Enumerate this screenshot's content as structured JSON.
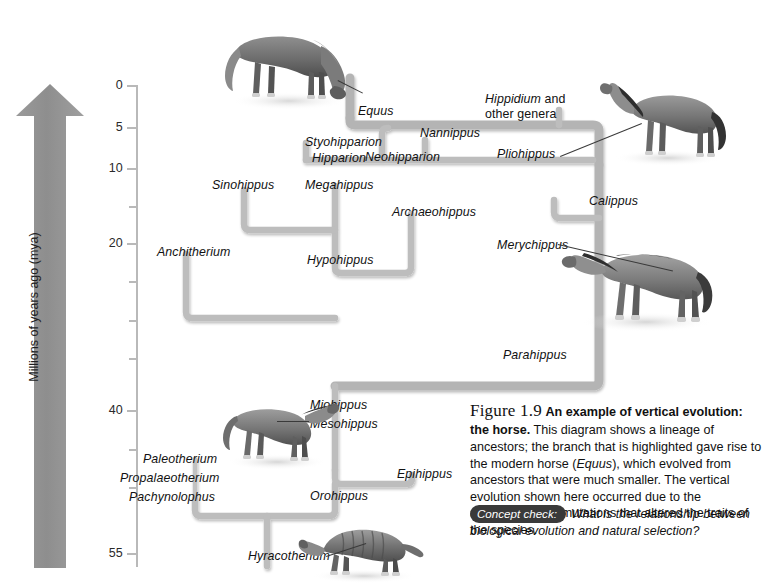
{
  "figure": {
    "number": "Figure 1.9",
    "title": "An example of vertical evolution: the horse.",
    "body_1": "This diagram shows a lineage of ancestors; the branch that is highlighted gave rise to the modern horse (",
    "body_italic": "Equus",
    "body_2": "), which evolved from ancestors that were much smaller. The vertical evolution shown here occurred due to the accumulation of mutations that altered the traits of the species.",
    "concept_check_tag": "Concept check:",
    "concept_check_question": "What is the relationship between biological evolution and natural selection?"
  },
  "axis": {
    "title": "Millions of years ago (mya)",
    "labels": [
      "0",
      "5",
      "10",
      "20",
      "40",
      "55"
    ],
    "ticks": [
      {
        "value": "0",
        "y": 85,
        "major": true,
        "label": "0"
      },
      {
        "value": "5",
        "y": 127,
        "major": true,
        "label": "5"
      },
      {
        "value": "10",
        "y": 168,
        "major": true,
        "label": "10"
      },
      {
        "value": "15",
        "y": 206,
        "major": false,
        "label": ""
      },
      {
        "value": "20",
        "y": 243,
        "major": true,
        "label": "20"
      },
      {
        "value": "25",
        "y": 281,
        "major": false,
        "label": ""
      },
      {
        "value": "30",
        "y": 320,
        "major": false,
        "label": ""
      },
      {
        "value": "35",
        "y": 358,
        "major": false,
        "label": ""
      },
      {
        "value": "40",
        "y": 410,
        "major": true,
        "label": "40"
      },
      {
        "value": "45",
        "y": 449,
        "major": false,
        "label": ""
      },
      {
        "value": "50",
        "y": 487,
        "major": false,
        "label": ""
      },
      {
        "value": "55",
        "y": 553,
        "major": true,
        "label": "55"
      }
    ],
    "arrow_direction": "up"
  },
  "taxa": [
    {
      "name": "Equus",
      "x": 358,
      "y": 104,
      "align": "left"
    },
    {
      "name": "Styohipparion",
      "x": 305,
      "y": 135,
      "align": "left"
    },
    {
      "name": "Nannippus",
      "x": 420,
      "y": 126,
      "align": "left"
    },
    {
      "name": "Neohipparion",
      "x": 365,
      "y": 150,
      "align": "left"
    },
    {
      "name": "Hipparion",
      "x": 312,
      "y": 151,
      "align": "left"
    },
    {
      "name": "Pliohippus",
      "x": 497,
      "y": 147,
      "align": "left"
    },
    {
      "name": "Sinohippus",
      "x": 212,
      "y": 178,
      "align": "left"
    },
    {
      "name": "Megahippus",
      "x": 305,
      "y": 178,
      "align": "left"
    },
    {
      "name": "Calippus",
      "x": 589,
      "y": 194,
      "align": "left"
    },
    {
      "name": "Archaeohippus",
      "x": 392,
      "y": 205,
      "align": "left"
    },
    {
      "name": "Anchitherium",
      "x": 157,
      "y": 245,
      "align": "left"
    },
    {
      "name": "Hypohippus",
      "x": 307,
      "y": 253,
      "align": "left"
    },
    {
      "name": "Merychippus",
      "x": 497,
      "y": 238,
      "align": "left"
    },
    {
      "name": "Parahippus",
      "x": 503,
      "y": 348,
      "align": "left"
    },
    {
      "name": "Miohippus",
      "x": 310,
      "y": 398,
      "align": "left"
    },
    {
      "name": "Mesohippus",
      "x": 310,
      "y": 417,
      "align": "left"
    },
    {
      "name": "Paleotherium",
      "x": 143,
      "y": 452,
      "align": "left"
    },
    {
      "name": "Epihippus",
      "x": 397,
      "y": 467,
      "align": "left"
    },
    {
      "name": "Propalaeotherium",
      "x": 130,
      "y": 471,
      "align": "left"
    },
    {
      "name": "Pachynolophus",
      "x": 139,
      "y": 490,
      "align": "left"
    },
    {
      "name": "Orohippus",
      "x": 310,
      "y": 489,
      "align": "left"
    },
    {
      "name": "Hyracotherium",
      "x": 248,
      "y": 549,
      "align": "left"
    }
  ],
  "taxa_multiline": [
    {
      "line1": "Hippidium",
      "line2": " and",
      "line3": "other genera",
      "x": 485,
      "y": 95
    }
  ],
  "illustrations": [
    {
      "name": "modern-horse-grazing",
      "label": "Equus",
      "x": 215,
      "y": 18,
      "w": 140,
      "h": 90
    },
    {
      "name": "pliohippus-horse",
      "label": "Pliohippus",
      "x": 600,
      "y": 72,
      "w": 135,
      "h": 95
    },
    {
      "name": "merychippus-horse",
      "label": "Merychippus",
      "x": 562,
      "y": 228,
      "w": 160,
      "h": 105
    },
    {
      "name": "mesohippus-horse",
      "label": "Mesohippus",
      "x": 215,
      "y": 392,
      "w": 120,
      "h": 78
    },
    {
      "name": "hyracotherium-animal",
      "label": "Hyracotherium",
      "x": 300,
      "y": 520,
      "w": 125,
      "h": 62
    }
  ],
  "colors": {
    "branch": "#b2b2b2",
    "branch_highlight": "#9a9a9a",
    "arrow": "#8c8c8c",
    "axis": "#b9b9b9",
    "text": "#111111",
    "tag_background": "#3a3a3a"
  }
}
